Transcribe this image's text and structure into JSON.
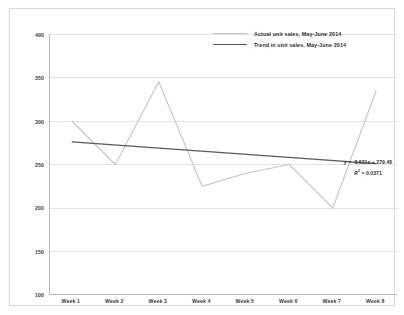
{
  "chart_data": {
    "type": "line",
    "title": "",
    "xlabel": "",
    "ylabel": "",
    "categories": [
      "Week 1",
      "Week 2",
      "Week 3",
      "Week 4",
      "Week 5",
      "Week 6",
      "Week 7",
      "Week 8"
    ],
    "ylim": [
      100,
      400
    ],
    "yticks": [
      400,
      350,
      300,
      250,
      200,
      150,
      100
    ],
    "ytick_labels": [
      "400",
      "350",
      "300",
      "250",
      "200",
      "150",
      "100"
    ],
    "grid": true,
    "legend_position": "top-right",
    "series": [
      {
        "name": "Actual unit sales, May-June 2014",
        "color": "#c6c6c6",
        "values": [
          300,
          250,
          345,
          225,
          240,
          250,
          200,
          335
        ]
      },
      {
        "name": "Trend in unit sales, May-June 2014",
        "color": "#595959",
        "values": [
          276,
          272,
          269,
          265,
          261,
          258,
          254,
          251
        ]
      }
    ],
    "annotations": {
      "equation": "y = -3.631x + 279.46",
      "r_squared_prefix": "R",
      "r_squared_exponent": "2",
      "r_squared_value": " = 0.0371"
    }
  },
  "legend": {
    "items": [
      {
        "label": "Actual unit sales, May-June 2014"
      },
      {
        "label": "Trend in unit sales, May-June 2014"
      }
    ]
  },
  "colors": {
    "actual_series": "#c6c6c6",
    "trend_series": "#595959",
    "gridline": "#e2e2e2",
    "axis": "#b9b9b9",
    "frame": "#d8d8d8",
    "text": "#2f2f2f"
  }
}
